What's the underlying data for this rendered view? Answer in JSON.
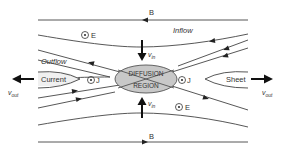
{
  "diagram": {
    "labels": {
      "field_top": "B",
      "field_bottom": "B",
      "inflow": "Inflow",
      "outflow": "Outflow",
      "current": "Current",
      "sheet": "Sheet",
      "diffusion_line1": "DIFFUSION",
      "diffusion_line2": "REGION",
      "vin_top": "v",
      "vin_top_sub": "in",
      "vin_bottom": "v",
      "vin_bottom_sub": "in",
      "vout_left": "v",
      "vout_left_sub": "out",
      "vout_right": "v",
      "vout_right_sub": "out",
      "e_top": "E",
      "e_bottom": "E",
      "j_left": "J",
      "j_right": "J"
    },
    "symbols": {
      "out_of_page": "circle-dot"
    },
    "colors": {
      "line": "#333333",
      "diffusion_fill": "#c8c8c8",
      "text": "#333333"
    }
  }
}
